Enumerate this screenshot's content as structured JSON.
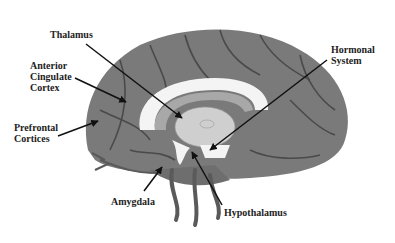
{
  "diagram": {
    "type": "brain-midsagittal",
    "colors": {
      "cortex": "#7a7a7a",
      "vessels": "#4a4a4a",
      "corpus_callosum": "#f4f4f4",
      "thalamus": "#cfcfcf",
      "inner_ring": "#a8a8a8",
      "arrows": "#111111",
      "text": "#222222"
    },
    "labels": {
      "thalamus": "Thalamus",
      "anterior_cingulate": "Anterior\nCingulate\nCortex",
      "prefrontal": "Prefrontal\nCortices",
      "hormonal": "Hormonal\nSystem",
      "amygdala": "Amygdala",
      "hypothalamus": "Hypothalamus"
    }
  }
}
